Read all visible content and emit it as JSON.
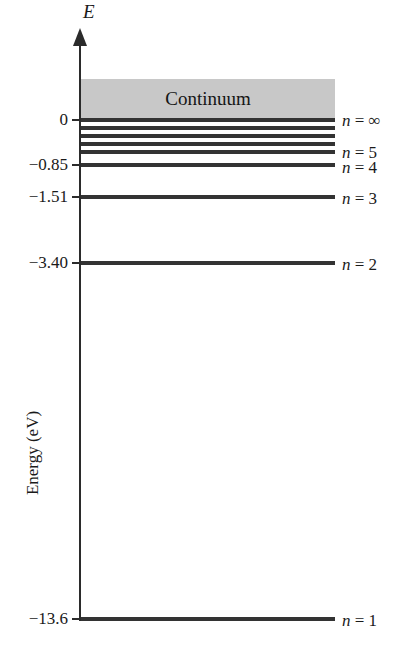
{
  "figure": {
    "axis_symbol": "E",
    "axis_title": "Energy (eV)",
    "continuum_label": "Continuum",
    "band_color": "#c8c8c8",
    "line_color": "#333333",
    "axis_color": "#2b2b2b"
  },
  "chart_data": {
    "type": "line",
    "xlabel": "",
    "ylabel": "Energy (eV)",
    "ylim": [
      -13.6,
      1.2
    ],
    "grid": false,
    "legend": "right",
    "annotations": [
      "Continuum"
    ],
    "continuum_region": {
      "label": "Continuum",
      "from": 0.0,
      "to": 1.2,
      "color": "#c8c8c8"
    },
    "y_ticks": [
      {
        "label": "0",
        "value": 0.0
      },
      {
        "label": "−0.85",
        "value": -0.85
      },
      {
        "label": "−1.51",
        "value": -1.51
      },
      {
        "label": "−3.40",
        "value": -3.4
      },
      {
        "label": "−13.6",
        "value": -13.6
      }
    ],
    "levels": [
      {
        "n": "∞",
        "label": "n = ∞",
        "energy": 0.0,
        "y": 120,
        "labeled": true,
        "thickness": 4
      },
      {
        "n": "8",
        "label": "",
        "energy": -0.21,
        "y": 128,
        "labeled": false,
        "thickness": 4
      },
      {
        "n": "7",
        "label": "",
        "energy": -0.28,
        "y": 136,
        "labeled": false,
        "thickness": 4
      },
      {
        "n": "6",
        "label": "",
        "energy": -0.38,
        "y": 144,
        "labeled": false,
        "thickness": 4
      },
      {
        "n": "5",
        "label": "n = 5",
        "energy": -0.54,
        "y": 152,
        "labeled": true,
        "thickness": 4
      },
      {
        "n": "4",
        "label": "n = 4",
        "energy": -0.85,
        "y": 165,
        "labeled": true,
        "thickness": 4
      },
      {
        "n": "3",
        "label": "n = 3",
        "energy": -1.51,
        "y": 197,
        "labeled": true,
        "thickness": 4
      },
      {
        "n": "2",
        "label": "n = 2",
        "energy": -3.4,
        "y": 263,
        "labeled": true,
        "thickness": 4
      },
      {
        "n": "1",
        "label": "n = 1",
        "energy": -13.6,
        "y": 619,
        "labeled": true,
        "thickness": 4
      }
    ],
    "n_labels": [
      {
        "text_n": "n",
        "eq": "=",
        "value": "∞",
        "y": 112
      },
      {
        "text_n": "n",
        "eq": "=",
        "value": "5",
        "y": 144
      },
      {
        "text_n": "n",
        "eq": "=",
        "value": "4",
        "y": 159
      },
      {
        "text_n": "n",
        "eq": "=",
        "value": "3",
        "y": 190
      },
      {
        "text_n": "n",
        "eq": "=",
        "value": "2",
        "y": 256
      },
      {
        "text_n": "n",
        "eq": "=",
        "value": "1",
        "y": 612
      }
    ]
  }
}
